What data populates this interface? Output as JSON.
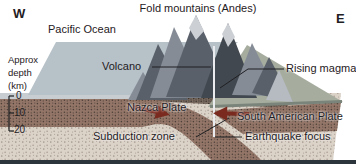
{
  "compass": {
    "west": "W",
    "east": "E"
  },
  "title": "Fold mountains (Andes)",
  "ocean_label": "Pacific Ocean",
  "depth_scale": {
    "label_lines": [
      "Approx",
      "depth",
      "(km)"
    ],
    "ticks": [
      "0",
      "10",
      "20"
    ]
  },
  "features": {
    "volcano": "Volcano",
    "rising_magma": "Rising magma",
    "nazca_plate": "Nazca Plate",
    "subduction_zone": "Subduction zone",
    "south_american_plate": "South American Plate",
    "earthquake_focus": "Earthquake focus"
  },
  "colors": {
    "ocean_surface": "#b7c1c8",
    "plain_surface": "#a6ad9f",
    "plain_edge": "#7b847a",
    "seafloor_edge": "#c8cdd2",
    "mantle_base": "#dbd2c8",
    "mantle_dots": "#a2958b",
    "plate_base": "#947668",
    "plate_dots": "#4e4038",
    "crust_base": "#786a5f",
    "crust_dots": "#3d342e",
    "mountain_light": "#b6bbc2",
    "mountain_mid": "#868c96",
    "mountain_dark": "#5a606a",
    "mountain_darkest": "#42484f",
    "mountain_snow": "#ccd0d5",
    "conduit": "#e9ebee",
    "arrow": "#7a2a1e",
    "line": "#1f2023",
    "border": "#2c343c"
  }
}
